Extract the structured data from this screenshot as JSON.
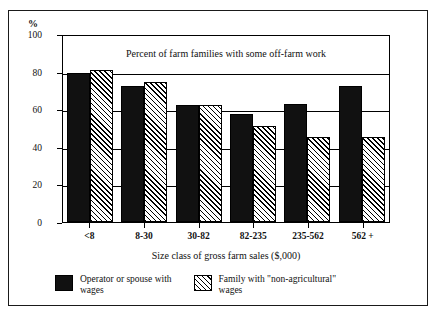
{
  "figure": {
    "unit_label": "%",
    "axis_title": "Size class of gross farm sales ($,000)"
  },
  "chart_data": {
    "type": "bar",
    "title": "Percent of farm families with some off-farm work",
    "xlabel": "Size class of gross farm sales ($,000)",
    "ylabel": "%",
    "ylim": [
      0,
      100
    ],
    "yticks": [
      0,
      20,
      40,
      60,
      80,
      100
    ],
    "grid": true,
    "legend_position": "bottom",
    "categories": [
      "<8",
      "8-30",
      "30-82",
      "82-235",
      "235-562",
      "562 +"
    ],
    "series": [
      {
        "name": "Operator or spouse with wages",
        "pattern": "solid-black",
        "color": "#111111",
        "values": [
          79,
          72.5,
          62,
          57.5,
          63,
          72.5
        ]
      },
      {
        "name": "Family with \"non-agricultural\" wages",
        "pattern": "diagonal-hatch",
        "color": "#ffffff",
        "values": [
          81,
          74.5,
          62,
          51,
          45,
          45
        ]
      }
    ]
  },
  "legend": {
    "items": [
      {
        "label_line1": "Operator or spouse with",
        "label_line2": "wages"
      },
      {
        "label_line1": "Family with \"non-agricultural\"",
        "label_line2": "wages"
      }
    ]
  }
}
